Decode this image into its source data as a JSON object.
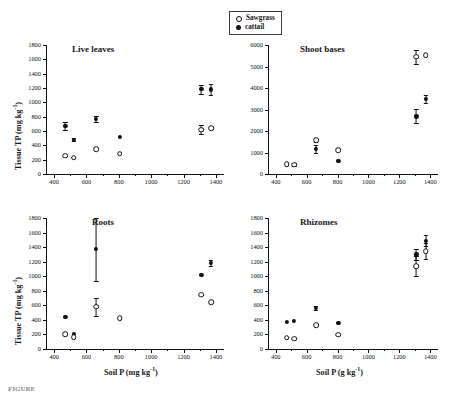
{
  "legend": {
    "items": [
      {
        "label": "Sawgrass",
        "marker": "open-circle"
      },
      {
        "label": "cattail",
        "marker": "filled-circle"
      }
    ]
  },
  "axis_titles": {
    "y_left": "Tissue TP (mg kg",
    "y_left_sup": "-1",
    "y_left_close": ")",
    "x_left": "Soil P (mg kg",
    "x_left_sup": "-1",
    "x_left_close": ")",
    "x_right": "Soil P (g kg",
    "x_right_sup": "-1",
    "x_right_close": ")"
  },
  "chart_data": [
    {
      "type": "scatter",
      "title": "Live leaves",
      "xlabel": "Soil P (mg kg-1)",
      "ylabel": "Tissue TP (mg kg-1)",
      "xlim": [
        350,
        1450
      ],
      "ylim": [
        0,
        1800
      ],
      "xticks": [
        400,
        600,
        800,
        1000,
        1200,
        1400
      ],
      "yticks": [
        0,
        200,
        400,
        600,
        800,
        1000,
        1200,
        1400,
        1600,
        1800
      ],
      "grid": false,
      "legend_position": "top-center-outside",
      "series": [
        {
          "name": "Sawgrass",
          "marker": "open-circle",
          "points": [
            {
              "x": 470,
              "y": 255,
              "yerr": 0
            },
            {
              "x": 520,
              "y": 230,
              "yerr": 0
            },
            {
              "x": 660,
              "y": 350,
              "yerr": 0
            },
            {
              "x": 805,
              "y": 282,
              "yerr": 0
            },
            {
              "x": 1310,
              "y": 618,
              "yerr": 62
            },
            {
              "x": 1370,
              "y": 640,
              "yerr": 0
            }
          ]
        },
        {
          "name": "cattail",
          "marker": "filled-circle",
          "points": [
            {
              "x": 470,
              "y": 672,
              "yerr": 52
            },
            {
              "x": 520,
              "y": 480,
              "yerr": 20
            },
            {
              "x": 660,
              "y": 765,
              "yerr": 38
            },
            {
              "x": 805,
              "y": 512,
              "yerr": 0
            },
            {
              "x": 1310,
              "y": 1185,
              "yerr": 62
            },
            {
              "x": 1370,
              "y": 1180,
              "yerr": 72
            }
          ]
        }
      ]
    },
    {
      "type": "scatter",
      "title": "Shoot bases",
      "xlabel": "Soil P (g kg-1)",
      "ylabel": "Tissue TP (mg kg-1)",
      "xlim": [
        350,
        1450
      ],
      "ylim": [
        0,
        6000
      ],
      "xticks": [
        400,
        600,
        800,
        1000,
        1200,
        1400
      ],
      "yticks": [
        0,
        1000,
        2000,
        3000,
        4000,
        5000,
        6000
      ],
      "grid": false,
      "series": [
        {
          "name": "Sawgrass",
          "marker": "open-circle",
          "points": [
            {
              "x": 470,
              "y": 455,
              "yerr": 0
            },
            {
              "x": 520,
              "y": 430,
              "yerr": 0
            },
            {
              "x": 660,
              "y": 1560,
              "yerr": 60
            },
            {
              "x": 805,
              "y": 1110,
              "yerr": 0
            },
            {
              "x": 1310,
              "y": 5450,
              "yerr": 330
            },
            {
              "x": 1370,
              "y": 5530,
              "yerr": 0
            }
          ]
        },
        {
          "name": "cattail",
          "marker": "filled-circle",
          "points": [
            {
              "x": 470,
              "y": 450,
              "yerr": 0
            },
            {
              "x": 520,
              "y": 430,
              "yerr": 75
            },
            {
              "x": 660,
              "y": 1160,
              "yerr": 170
            },
            {
              "x": 805,
              "y": 620,
              "yerr": 0
            },
            {
              "x": 1310,
              "y": 2680,
              "yerr": 330
            },
            {
              "x": 1370,
              "y": 3490,
              "yerr": 180
            }
          ]
        }
      ]
    },
    {
      "type": "scatter",
      "title": "Roots",
      "xlabel": "Soil P (mg kg-1)",
      "ylabel": "Tissue TP (mg kg-1)",
      "xlim": [
        350,
        1450
      ],
      "ylim": [
        0,
        1800
      ],
      "xticks": [
        400,
        600,
        800,
        1000,
        1200,
        1400
      ],
      "yticks": [
        0,
        200,
        400,
        600,
        800,
        1000,
        1200,
        1400,
        1600,
        1800
      ],
      "grid": false,
      "series": [
        {
          "name": "Sawgrass",
          "marker": "open-circle",
          "points": [
            {
              "x": 470,
              "y": 200,
              "yerr": 0
            },
            {
              "x": 520,
              "y": 165,
              "yerr": 0
            },
            {
              "x": 660,
              "y": 580,
              "yerr": 125
            },
            {
              "x": 805,
              "y": 425,
              "yerr": 0
            },
            {
              "x": 1310,
              "y": 745,
              "yerr": 0
            },
            {
              "x": 1370,
              "y": 645,
              "yerr": 0
            }
          ]
        },
        {
          "name": "cattail",
          "marker": "filled-circle",
          "points": [
            {
              "x": 470,
              "y": 440,
              "yerr": 0
            },
            {
              "x": 520,
              "y": 210,
              "yerr": 0
            },
            {
              "x": 660,
              "y": 1370,
              "yerr": 430
            },
            {
              "x": 805,
              "y": 425,
              "yerr": 0
            },
            {
              "x": 1310,
              "y": 1020,
              "yerr": 0
            },
            {
              "x": 1370,
              "y": 1180,
              "yerr": 45
            }
          ]
        }
      ]
    },
    {
      "type": "scatter",
      "title": "Rhizomes",
      "xlabel": "Soil P (g kg-1)",
      "ylabel": "Tissue TP (mg kg-1)",
      "xlim": [
        350,
        1450
      ],
      "ylim": [
        0,
        1800
      ],
      "xticks": [
        400,
        600,
        800,
        1000,
        1200,
        1400
      ],
      "yticks": [
        0,
        200,
        400,
        600,
        800,
        1000,
        1200,
        1400,
        1600,
        1800
      ],
      "grid": false,
      "series": [
        {
          "name": "Sawgrass",
          "marker": "open-circle",
          "points": [
            {
              "x": 470,
              "y": 155,
              "yerr": 0
            },
            {
              "x": 520,
              "y": 140,
              "yerr": 0
            },
            {
              "x": 660,
              "y": 330,
              "yerr": 0
            },
            {
              "x": 805,
              "y": 195,
              "yerr": 0
            },
            {
              "x": 1310,
              "y": 1140,
              "yerr": 135
            },
            {
              "x": 1370,
              "y": 1345,
              "yerr": 115
            }
          ]
        },
        {
          "name": "cattail",
          "marker": "filled-circle",
          "points": [
            {
              "x": 470,
              "y": 375,
              "yerr": 0
            },
            {
              "x": 520,
              "y": 382,
              "yerr": 0
            },
            {
              "x": 660,
              "y": 560,
              "yerr": 25
            },
            {
              "x": 805,
              "y": 360,
              "yerr": 0
            },
            {
              "x": 1310,
              "y": 1300,
              "yerr": 72
            },
            {
              "x": 1370,
              "y": 1490,
              "yerr": 78
            }
          ]
        }
      ]
    }
  ],
  "caption": {
    "text": "FIGURE"
  }
}
